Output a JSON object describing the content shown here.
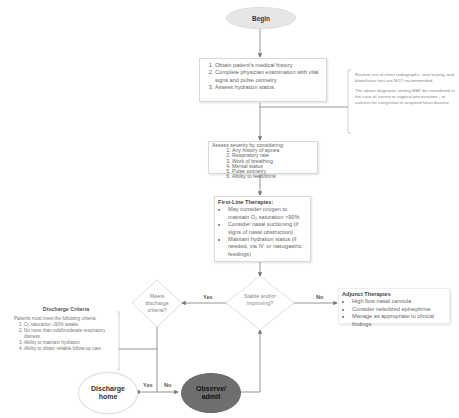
{
  "begin": {
    "label": "Begin"
  },
  "step1": {
    "items": [
      "Obtain patient's medical history",
      "Complete physician examination with vital signs and pulse oximetry",
      "Assess hydration status"
    ]
  },
  "side_note": {
    "paragraph1": "Routine use of chest radiographs, viral testing, and blood/urine test are NOT recommended.",
    "paragraph2": "The above diagnostic testing MAY be considered in the case of severe or atypical presentation - or concern for congenital or acquired heart disease"
  },
  "severity": {
    "title": "Assess severity by considering:",
    "items": [
      "Any history of apnea",
      "Respiratory rate",
      "Work of breathing",
      "Mental status",
      "Pulse oximetry",
      "Ability to feed/drink"
    ]
  },
  "first_line": {
    "title": "First-Line Therapies:",
    "items": [
      "May consider oxygen to maintain O₂ saturation >90%",
      "Consider nasal suctioning (if signs of nasal obstruction)",
      "Maintain hydration status (if needed, via IV, or nasogastric feedings)"
    ]
  },
  "stable_decision": {
    "text": "Stable and/or improving?",
    "yes_label": "Yes",
    "no_label": "No"
  },
  "adjunct": {
    "title": "Adjunct Therapies",
    "items": [
      "High flow nasal cannula",
      "Consider nebulized epinephrine",
      "Manage as appropriate to clinical findings"
    ]
  },
  "discharge_decision": {
    "text": "Meets discharge criteria?"
  },
  "discharge_criteria": {
    "title": "Discharge Criteria",
    "intro": "Patients must meet the following criteria:",
    "items": [
      "O₂ saturation ≥90% awake",
      "No more than mild/moderate respiratory distress",
      "Ability to maintain hydration",
      "Ability to obtain reliable follow-up care"
    ]
  },
  "discharge_home": {
    "label": "Discharge home",
    "yes_label": "Yes"
  },
  "observe_admit": {
    "label": "Observe/ admit",
    "no_label": "No"
  },
  "colors": {
    "begin_fill": "#e6e6e6",
    "observe_fill": "#6f6f6f",
    "line": "#888888",
    "box_border": "#d9d9d9"
  }
}
